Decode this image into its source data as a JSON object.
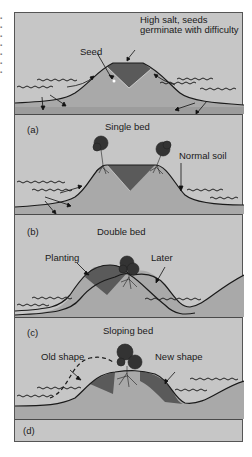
{
  "figure": {
    "panels": [
      {
        "id": "top",
        "title": "",
        "annotations": [
          {
            "text": "Seed"
          },
          {
            "text": "High salt, seeds germinate with difficulty"
          }
        ]
      },
      {
        "id": "a",
        "label": "(a)",
        "title": "Single bed",
        "annotations": [
          {
            "text": "Normal soil"
          }
        ]
      },
      {
        "id": "b",
        "label": "(b)",
        "title": "Double bed",
        "annotations": [
          {
            "text": "Planting"
          },
          {
            "text": "Later"
          }
        ]
      },
      {
        "id": "c",
        "label": "(c)",
        "title": "Sloping bed",
        "annotations": [
          {
            "text": "Old shape"
          },
          {
            "text": "New shape"
          }
        ]
      },
      {
        "id": "d",
        "label": "(d)",
        "title": ""
      }
    ],
    "colors": {
      "background": "#c6c6c6",
      "soil": "#a9a9a9",
      "salt_zone": "#5a5a5a",
      "outline": "#1a1a1a",
      "water": "#2a2a2a"
    }
  }
}
